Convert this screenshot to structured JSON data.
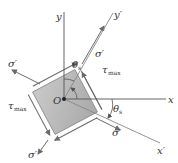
{
  "diagram": {
    "origin_label": "O",
    "axes": {
      "x": "x",
      "y": "y",
      "x_prime": "x′",
      "y_prime": "y′"
    },
    "angle": {
      "symbol": "θ",
      "subscript": "s"
    },
    "stresses": {
      "normal": "σ′",
      "shear_symbol": "τ",
      "shear_subscript": "max"
    },
    "colors": {
      "element_fill": "#bcbcbc",
      "element_edge": "#8a8a8a",
      "axis": "#555555",
      "arrow": "#6a6a6a",
      "text": "#333333",
      "background": "#ffffff"
    }
  }
}
